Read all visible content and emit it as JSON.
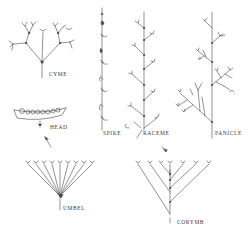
{
  "diagram": {
    "stroke_color": "#4a4a4a",
    "labels": {
      "cyme": "CYME",
      "spike": "SPIKE",
      "raceme": "RACEME",
      "panicle": "PANICLE",
      "head": "HEAD",
      "umbel": "UMBEL",
      "corymb": "CORYMB"
    }
  }
}
